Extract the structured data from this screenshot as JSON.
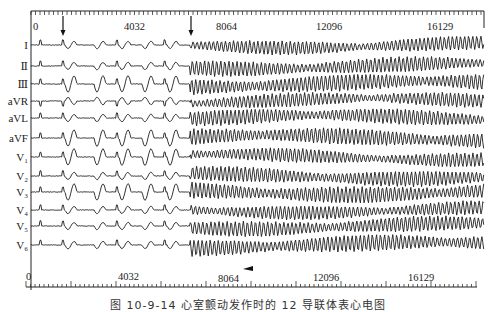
{
  "figure": {
    "caption": "图 10-9-14  心室颤动发作时的 12 导联体表心电图",
    "colors": {
      "trace": "#1c1c1c",
      "ruler": "#222222",
      "background": "#ffffff"
    }
  },
  "chart_data": {
    "type": "line",
    "xlabel": "sample index",
    "ylabel": "",
    "x_ticks": [
      0,
      4032,
      8064,
      12096,
      16129
    ],
    "xlim": [
      0,
      17500
    ],
    "grid": false,
    "legend": "none",
    "leads": [
      "I",
      "II",
      "III",
      "aVR",
      "aVL",
      "aVF",
      "V1",
      "V2",
      "V3",
      "V4",
      "V5",
      "V6"
    ],
    "annotations": [
      {
        "type": "arrow-down",
        "x_sample": 1100,
        "label": ""
      },
      {
        "type": "arrow-down",
        "x_sample": 7600,
        "label": ""
      }
    ],
    "segments": [
      {
        "phase": "sinus / premature beats",
        "from": 0,
        "to": 7600
      },
      {
        "phase": "ventricular fibrillation",
        "from": 7600,
        "to": 17500
      }
    ]
  },
  "leads": [
    {
      "label": "I",
      "y": 45
    },
    {
      "label": "Ⅱ",
      "y": 66
    },
    {
      "label": "Ⅲ",
      "y": 84
    },
    {
      "label": "aVR",
      "y": 101
    },
    {
      "label": "aVL",
      "y": 118
    },
    {
      "label": "aVF",
      "y": 138
    },
    {
      "label": "V₁",
      "y": 157
    },
    {
      "label": "V₂",
      "y": 176
    },
    {
      "label": "V₃",
      "y": 192
    },
    {
      "label": "V₄",
      "y": 210
    },
    {
      "label": "V₅",
      "y": 226
    },
    {
      "label": "V₆",
      "y": 245
    }
  ],
  "rulers": {
    "top": {
      "labels": [
        "0",
        "4032",
        "8064",
        "12096",
        "16129"
      ]
    },
    "bottom": {
      "labels": [
        "0",
        "4032",
        "8064",
        "12096",
        "16129"
      ]
    }
  }
}
